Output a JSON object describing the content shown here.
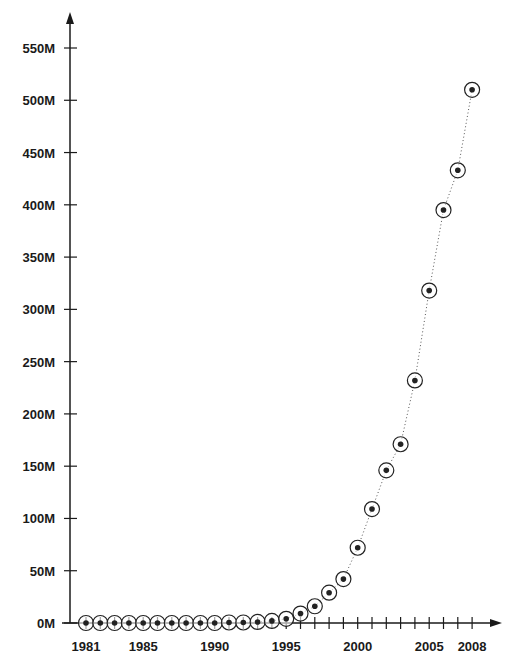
{
  "chart_data": {
    "type": "line",
    "title": "",
    "xlabel": "",
    "ylabel": "",
    "x": [
      1981,
      1982,
      1983,
      1984,
      1985,
      1986,
      1987,
      1988,
      1989,
      1990,
      1991,
      1992,
      1993,
      1994,
      1995,
      1996,
      1997,
      1998,
      1999,
      2000,
      2001,
      2002,
      2003,
      2004,
      2005,
      2006,
      2007,
      2008
    ],
    "series": [
      {
        "name": "Values",
        "values": [
          0,
          0,
          0,
          0,
          0,
          0,
          0,
          0,
          0,
          0,
          0.5,
          0.5,
          1,
          2,
          4,
          9,
          16,
          29,
          42,
          72,
          109,
          146,
          171,
          232,
          318,
          395,
          433,
          510
        ]
      }
    ],
    "ylim": [
      0,
      560
    ],
    "y_ticks": [
      0,
      50,
      100,
      150,
      200,
      250,
      300,
      350,
      400,
      450,
      500,
      550
    ],
    "y_tick_labels": [
      "0M",
      "50M",
      "100M",
      "150M",
      "200M",
      "250M",
      "300M",
      "350M",
      "400M",
      "450M",
      "500M",
      "550M"
    ],
    "x_tick_labels": [
      {
        "year": 1981,
        "label": "1981"
      },
      {
        "year": 1985,
        "label": "1985"
      },
      {
        "year": 1990,
        "label": "1990"
      },
      {
        "year": 1995,
        "label": "1995"
      },
      {
        "year": 2000,
        "label": "2000"
      },
      {
        "year": 2005,
        "label": "2005"
      },
      {
        "year": 2008,
        "label": "2008"
      }
    ],
    "grid": false,
    "legend": "none",
    "marker": "circled-dot",
    "line_style": "dotted",
    "colors": {
      "axis": "#1a1a1a",
      "marker": "#222222",
      "line": "#555555",
      "background": "#ffffff"
    }
  }
}
